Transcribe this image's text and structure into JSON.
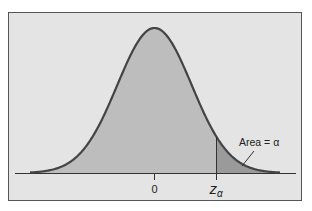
{
  "figure": {
    "colors": {
      "page_background": "#ffffff",
      "panel_background": "#e4e4e4",
      "panel_border": "#555555",
      "body_fill": "#bdbdbd",
      "tail_fill": "#9a9a9a",
      "curve_stroke": "#444444",
      "axis_stroke": "#333333",
      "text": "#222222"
    },
    "labels": {
      "center_tick": "0",
      "critical_value_main": "z",
      "critical_value_sub": "α",
      "area_annotation": "Area = α"
    }
  },
  "chart_data": {
    "type": "area",
    "title": "",
    "xlabel": "",
    "ylabel": "",
    "distribution": "standard normal",
    "mean": 0,
    "x_ticks": [
      {
        "value": 0,
        "label": "0"
      },
      {
        "value": "z_alpha",
        "label": "zα"
      }
    ],
    "shaded_regions": [
      {
        "from": "-inf",
        "to": "z_alpha",
        "fill": "#bdbdbd",
        "label": ""
      },
      {
        "from": "z_alpha",
        "to": "+inf",
        "fill": "#9a9a9a",
        "label": "Area = α"
      }
    ],
    "annotations": [
      {
        "text": "Area = α",
        "points_to": "right tail beyond z_alpha"
      }
    ],
    "grid": false,
    "legend": false,
    "approx_z_alpha_in_sd": 1.67
  }
}
